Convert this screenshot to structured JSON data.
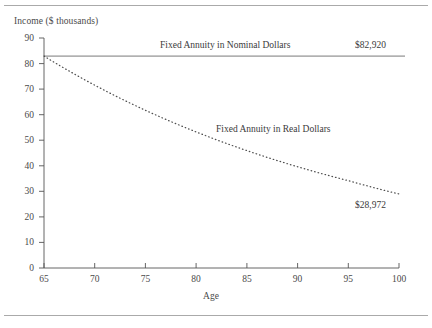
{
  "figure": {
    "top_rule": true,
    "bottom_rule": true
  },
  "chart_data": {
    "type": "line",
    "title": "",
    "xlabel": "Age",
    "ylabel": "Income ($ thousands)",
    "xlim": [
      65,
      100
    ],
    "ylim": [
      0,
      90
    ],
    "xticks": [
      65,
      70,
      75,
      80,
      85,
      90,
      95,
      100
    ],
    "yticks": [
      0,
      10,
      20,
      30,
      40,
      50,
      60,
      70,
      80,
      90
    ],
    "grid": false,
    "legend": "inline-annotations",
    "x": [
      65,
      70,
      75,
      80,
      85,
      90,
      95,
      100
    ],
    "series": [
      {
        "name": "Fixed Annuity in Nominal Dollars",
        "style": "solid",
        "values": [
          82.92,
          82.92,
          82.92,
          82.92,
          82.92,
          82.92,
          82.92,
          82.92
        ],
        "end_label": "$82,920"
      },
      {
        "name": "Fixed Annuity in Real Dollars",
        "style": "dotted",
        "values": [
          82.92,
          71.53,
          61.71,
          53.24,
          45.93,
          39.62,
          34.18,
          28.97
        ],
        "end_label": "$28,972"
      }
    ],
    "annotations": [
      {
        "text": "Fixed Annuity in Nominal Dollars",
        "x": 80.3,
        "y": 86.2
      },
      {
        "text": "$82,920",
        "x": 96.8,
        "y": 86.2
      },
      {
        "text": "Fixed Annuity in Real Dollars",
        "x": 85.0,
        "y": 53.5
      },
      {
        "text": "$28,972",
        "x": 96.8,
        "y": 23.8
      }
    ]
  },
  "axis": {
    "y_title": "Income ($ thousands)",
    "x_title": "Age",
    "y_labels": [
      "90",
      "80",
      "70",
      "60",
      "50",
      "40",
      "30",
      "20",
      "10",
      "0"
    ],
    "x_labels": [
      "65",
      "70",
      "75",
      "80",
      "85",
      "90",
      "95",
      "100"
    ]
  },
  "colors": {
    "axis": "#555555",
    "nominal_line": "#666666",
    "real_line": "#555555",
    "text": "#3a3a3a",
    "rule": "#aaaaaa"
  }
}
